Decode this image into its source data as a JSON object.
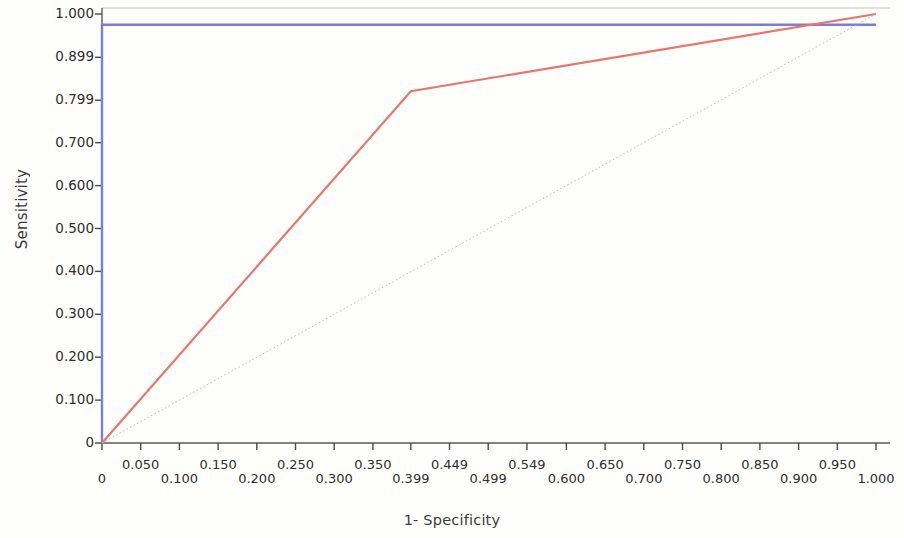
{
  "chart_data": {
    "type": "line",
    "title": "",
    "xlabel": "1- Specificity",
    "ylabel": "Sensitivity",
    "xlim": [
      0,
      1.0
    ],
    "ylim": [
      0,
      1.0
    ],
    "grid": false,
    "legend": "none",
    "x_tick_labels": [
      "0",
      "0.050",
      "0.100",
      "0.150",
      "0.200",
      "0.250",
      "0.300",
      "0.350",
      "0.399",
      "0.449",
      "0.499",
      "0.549",
      "0.600",
      "0.650",
      "0.700",
      "0.750",
      "0.800",
      "0.850",
      "0.900",
      "0.950",
      "1.000"
    ],
    "x_tick_values": [
      0,
      0.05,
      0.1,
      0.15,
      0.2,
      0.25,
      0.3,
      0.35,
      0.399,
      0.449,
      0.499,
      0.549,
      0.6,
      0.65,
      0.7,
      0.75,
      0.8,
      0.85,
      0.9,
      0.95,
      1.0
    ],
    "y_tick_labels": [
      "1.000",
      "0.899",
      "0.799",
      "0.700",
      "0.600",
      "0.500",
      "0.400",
      "0.300",
      "0.200",
      "0.100",
      "0"
    ],
    "y_tick_values": [
      1.0,
      0.899,
      0.799,
      0.7,
      0.6,
      0.5,
      0.4,
      0.3,
      0.2,
      0.1,
      0
    ],
    "series": [
      {
        "name": "roc-curve-blue",
        "color": "#7b7fd4",
        "style": "solid",
        "width": 2.4,
        "points": [
          [
            0,
            0
          ],
          [
            0,
            0.975
          ],
          [
            0.9,
            0.975
          ],
          [
            1.0,
            0.975
          ]
        ]
      },
      {
        "name": "roc-curve-red",
        "color": "#e8776a",
        "style": "solid",
        "width": 2.2,
        "points": [
          [
            0,
            0
          ],
          [
            0.399,
            0.82
          ],
          [
            1.0,
            1.0
          ]
        ]
      },
      {
        "name": "reference-diagonal",
        "color": "#b9b9c2",
        "style": "dotted",
        "width": 1.0,
        "points": [
          [
            0,
            0
          ],
          [
            1.0,
            1.0
          ]
        ]
      }
    ]
  },
  "axes": {
    "y_title": "Sensitivity",
    "x_title": "1- Specificity"
  }
}
